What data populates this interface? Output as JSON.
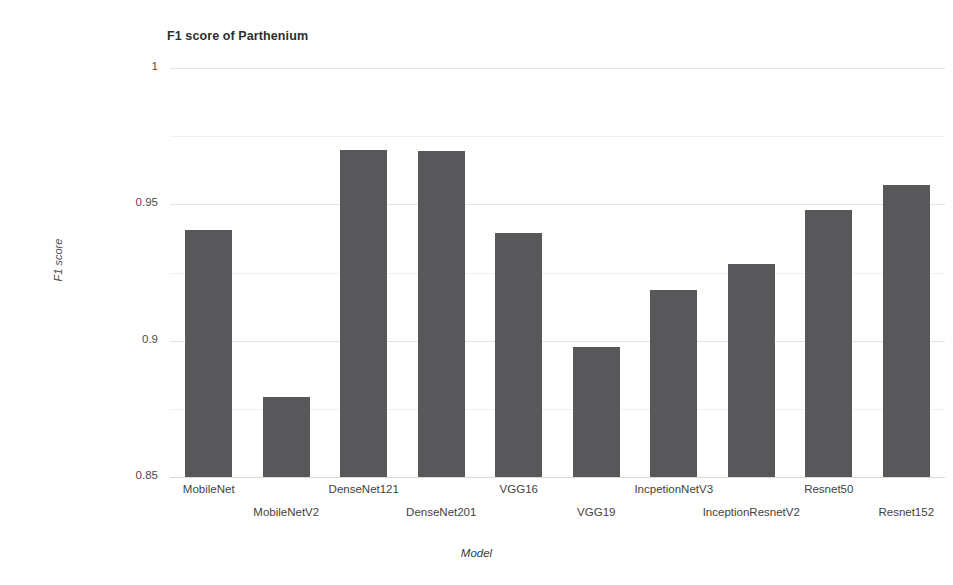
{
  "chart_data": {
    "type": "bar",
    "title": "F1 score of Parthenium",
    "xlabel": "Model",
    "ylabel": "F1 score",
    "ylim": [
      0.85,
      1.0
    ],
    "yticks": [
      "0.85",
      "0.9",
      "0.95",
      "1"
    ],
    "ytick_values": [
      0.85,
      0.9,
      0.95,
      1.0
    ],
    "grid": true,
    "legend": "none",
    "bar_color": "#58585a",
    "gridline_color": "#e3e3e6",
    "categories": [
      "MobileNet",
      "MobileNetV2",
      "DenseNet121",
      "DenseNet201",
      "VGG16",
      "VGG19",
      "IncpetionNetV3",
      "InceptionResnetV2",
      "Resnet50",
      "Resnet152"
    ],
    "values": [
      0.9406,
      0.8794,
      0.9699,
      0.9695,
      0.9395,
      0.8977,
      0.9186,
      0.9281,
      0.9479,
      0.9571
    ]
  }
}
